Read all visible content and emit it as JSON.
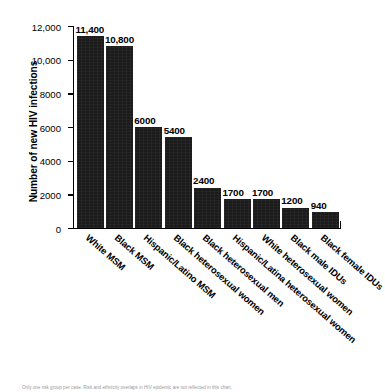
{
  "chart_data": {
    "type": "bar",
    "title": "",
    "xlabel": "",
    "ylabel": "Number of new HIV infections",
    "ylim": [
      0,
      12000
    ],
    "yticks": [
      0,
      2000,
      4000,
      6000,
      8000,
      10000,
      12000
    ],
    "ytick_labels": [
      "0",
      "2000",
      "4000",
      "6000",
      "8000",
      "10,000",
      "12,000"
    ],
    "grid": false,
    "legend": "none",
    "bar_color": "#1b1b1b",
    "categories": [
      "White MSM",
      "Black MSM",
      "Hispanic/Latino MSM",
      "Black heterosexual women",
      "Black heterosexual men",
      "Hispanic/Latina heterosexual women",
      "White heterosexual women",
      "Black male IDUs",
      "Black female IDUs"
    ],
    "values": [
      11400,
      10800,
      6000,
      5400,
      2400,
      1700,
      1700,
      1200,
      940
    ],
    "value_labels": [
      "11,400",
      "10,800",
      "6000",
      "5400",
      "2400",
      "1700",
      "1700",
      "1200",
      "940"
    ]
  },
  "footnote": {
    "text": "Only one risk group per case. Risk and ethnicity overlaps in HIV epidemic are not reflected in this chart."
  }
}
